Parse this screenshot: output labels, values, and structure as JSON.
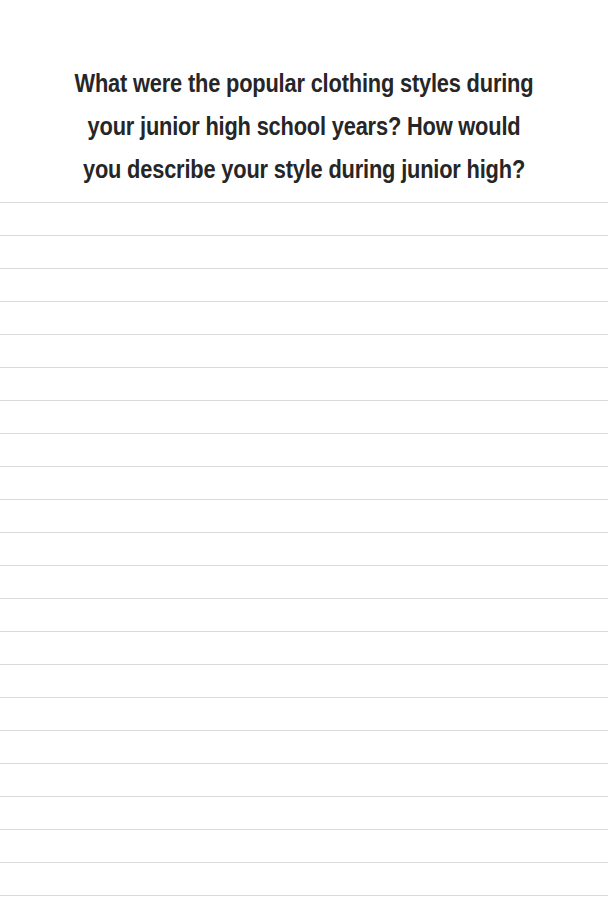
{
  "page": {
    "width": 608,
    "height": 919,
    "background_color": "#ffffff",
    "kind": "journal-prompt-page"
  },
  "prompt": {
    "text": "What were the popular clothing styles during your junior high school years? How would you describe your style during junior high?",
    "lines": [
      "What were the popular clothing styles during your junior",
      "high school years? How would you describe your style",
      "during junior high?"
    ],
    "text_color": "#262626",
    "alignment": "center",
    "font_weight": "bold"
  },
  "writing_area": {
    "label": "Lined writing space",
    "line_count": 22,
    "line_color": "#d9dadd",
    "line_thickness_px": 1,
    "first_line_y": 202,
    "line_spacing_px": 33,
    "full_bleed": true
  }
}
